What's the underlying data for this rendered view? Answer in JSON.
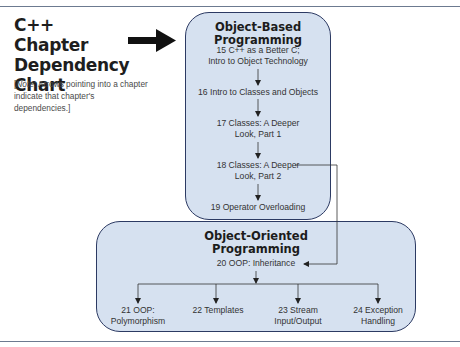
{
  "title": "C++ Chapter Dependency Chart",
  "title_lines": [
    "C++ Chapter",
    "Dependency",
    "Chart"
  ],
  "note": {
    "prefix": "[",
    "label": "Note:",
    "text": " Arrows pointing into a chapter indicate that chapter's dependencies.]"
  },
  "groups": [
    {
      "name": "Object-Based Programming",
      "title_lines": [
        "Object-Based",
        "Programming"
      ],
      "chapters": [
        {
          "number": "15",
          "lines": [
            "15 C++ as a Better C;",
            "Intro to Object Technology"
          ]
        },
        {
          "number": "16",
          "lines": [
            "16 Intro to Classes and Objects"
          ]
        },
        {
          "number": "17",
          "lines": [
            "17 Classes: A Deeper",
            "Look, Part 1"
          ]
        },
        {
          "number": "18",
          "lines": [
            "18 Classes: A Deeper",
            "Look, Part 2"
          ]
        },
        {
          "number": "19",
          "lines": [
            "19 Operator Overloading"
          ]
        }
      ]
    },
    {
      "name": "Object-Oriented Programming",
      "title_lines": [
        "Object-Oriented",
        "Programming"
      ],
      "chapters": [
        {
          "number": "20",
          "lines": [
            "20 OOP: Inheritance"
          ]
        },
        {
          "number": "21",
          "lines": [
            "21 OOP:",
            "Polymorphism"
          ]
        },
        {
          "number": "22",
          "lines": [
            "22 Templates"
          ]
        },
        {
          "number": "23",
          "lines": [
            "23 Stream",
            "Input/Output"
          ]
        },
        {
          "number": "24",
          "lines": [
            "24 Exception",
            "Handling"
          ]
        }
      ]
    }
  ],
  "dependencies": [
    {
      "from": "15",
      "to": "16"
    },
    {
      "from": "16",
      "to": "17"
    },
    {
      "from": "17",
      "to": "18"
    },
    {
      "from": "18",
      "to": "19"
    },
    {
      "from": "18",
      "to": "20"
    },
    {
      "from": "20",
      "to": "21"
    },
    {
      "from": "20",
      "to": "22"
    },
    {
      "from": "20",
      "to": "23"
    },
    {
      "from": "20",
      "to": "24"
    }
  ],
  "colors": {
    "box_fill": "#d6e1f0",
    "box_border": "#2c3a63",
    "rule": "#6c7a90",
    "arrow": "#111111"
  }
}
